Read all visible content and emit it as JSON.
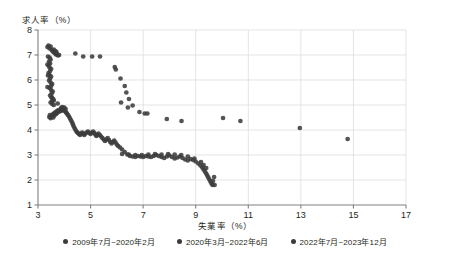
{
  "chart_data": {
    "type": "scatter",
    "title": "",
    "xlabel": "失業率（%）",
    "ylabel": "求人率（%）",
    "xlim": [
      3,
      17
    ],
    "ylim": [
      1,
      8
    ],
    "xticks": [
      3,
      5,
      7,
      9,
      11,
      13,
      15,
      17
    ],
    "yticks": [
      1,
      2,
      3,
      4,
      5,
      6,
      7,
      8
    ],
    "grid": true,
    "legend_position": "bottom",
    "marker_color": "#3c3c3c",
    "grid_color": "#d8d8d8",
    "axis_color": "#808080",
    "series": [
      {
        "name": "2009年7月~2020年2月",
        "color": "#3c3c3c",
        "points": [
          [
            3.43,
            4.52
          ],
          [
            3.45,
            4.6
          ],
          [
            3.48,
            4.47
          ],
          [
            3.52,
            4.55
          ],
          [
            3.55,
            4.62
          ],
          [
            3.58,
            4.5
          ],
          [
            3.6,
            4.66
          ],
          [
            3.62,
            4.58
          ],
          [
            3.65,
            4.7
          ],
          [
            3.68,
            4.63
          ],
          [
            3.7,
            4.74
          ],
          [
            3.72,
            4.68
          ],
          [
            3.75,
            4.78
          ],
          [
            3.78,
            4.72
          ],
          [
            3.8,
            4.8
          ],
          [
            3.83,
            4.75
          ],
          [
            3.86,
            4.82
          ],
          [
            3.9,
            4.77
          ],
          [
            3.93,
            4.83
          ],
          [
            3.96,
            4.79
          ],
          [
            4.0,
            4.8
          ],
          [
            4.04,
            4.74
          ],
          [
            4.07,
            4.7
          ],
          [
            4.1,
            4.66
          ],
          [
            4.14,
            4.6
          ],
          [
            4.18,
            4.54
          ],
          [
            4.22,
            4.46
          ],
          [
            4.26,
            4.38
          ],
          [
            4.3,
            4.3
          ],
          [
            4.33,
            4.22
          ],
          [
            4.36,
            4.14
          ],
          [
            4.4,
            4.06
          ],
          [
            4.44,
            3.98
          ],
          [
            4.48,
            3.92
          ],
          [
            4.52,
            3.88
          ],
          [
            4.56,
            3.84
          ],
          [
            4.6,
            3.8
          ],
          [
            4.64,
            3.86
          ],
          [
            4.68,
            3.9
          ],
          [
            4.72,
            3.84
          ],
          [
            4.76,
            3.8
          ],
          [
            4.8,
            3.86
          ],
          [
            4.85,
            3.9
          ],
          [
            4.9,
            3.94
          ],
          [
            4.95,
            3.88
          ],
          [
            5.0,
            3.84
          ],
          [
            5.05,
            3.9
          ],
          [
            5.1,
            3.94
          ],
          [
            5.14,
            3.88
          ],
          [
            5.18,
            3.82
          ],
          [
            5.22,
            3.76
          ],
          [
            5.26,
            3.8
          ],
          [
            5.3,
            3.86
          ],
          [
            5.35,
            3.8
          ],
          [
            5.4,
            3.74
          ],
          [
            5.45,
            3.68
          ],
          [
            5.5,
            3.62
          ],
          [
            5.55,
            3.56
          ],
          [
            5.6,
            3.62
          ],
          [
            5.65,
            3.68
          ],
          [
            5.7,
            3.6
          ],
          [
            5.75,
            3.52
          ],
          [
            5.8,
            3.46
          ],
          [
            5.85,
            3.52
          ],
          [
            5.9,
            3.58
          ],
          [
            5.95,
            3.5
          ],
          [
            6.0,
            3.42
          ],
          [
            6.05,
            3.36
          ],
          [
            6.12,
            3.3
          ],
          [
            6.2,
            3.22
          ],
          [
            6.3,
            3.12
          ],
          [
            6.4,
            3.02
          ],
          [
            6.5,
            2.96
          ],
          [
            6.6,
            2.94
          ],
          [
            6.7,
            2.92
          ],
          [
            6.8,
            2.96
          ],
          [
            6.9,
            2.94
          ],
          [
            7.0,
            2.92
          ],
          [
            7.1,
            2.96
          ],
          [
            7.2,
            2.94
          ],
          [
            7.3,
            2.92
          ],
          [
            7.4,
            2.96
          ],
          [
            7.5,
            3.0
          ],
          [
            7.6,
            2.96
          ],
          [
            7.7,
            2.92
          ],
          [
            7.8,
            2.88
          ],
          [
            7.9,
            2.94
          ],
          [
            8.0,
            2.98
          ],
          [
            8.1,
            2.92
          ],
          [
            8.2,
            2.86
          ],
          [
            8.3,
            2.9
          ],
          [
            8.4,
            2.94
          ],
          [
            8.5,
            2.88
          ],
          [
            8.6,
            2.82
          ],
          [
            8.7,
            2.78
          ],
          [
            8.8,
            2.84
          ],
          [
            8.9,
            2.8
          ],
          [
            9.0,
            2.74
          ],
          [
            9.1,
            2.66
          ],
          [
            9.18,
            2.58
          ],
          [
            9.25,
            2.5
          ],
          [
            9.3,
            2.42
          ],
          [
            9.35,
            2.34
          ],
          [
            9.4,
            2.26
          ],
          [
            9.44,
            2.18
          ],
          [
            9.48,
            2.1
          ],
          [
            9.52,
            2.02
          ],
          [
            9.56,
            1.94
          ],
          [
            9.6,
            1.86
          ],
          [
            9.64,
            1.8
          ],
          [
            9.4,
            2.48
          ],
          [
            9.3,
            2.6
          ],
          [
            9.2,
            2.72
          ],
          [
            8.95,
            2.86
          ],
          [
            8.7,
            2.94
          ],
          [
            8.45,
            3.0
          ],
          [
            8.2,
            3.02
          ],
          [
            7.95,
            3.04
          ],
          [
            7.7,
            3.02
          ],
          [
            7.45,
            3.04
          ],
          [
            7.2,
            3.02
          ],
          [
            6.95,
            3.0
          ],
          [
            6.7,
            3.0
          ],
          [
            6.45,
            3.02
          ],
          [
            6.2,
            3.04
          ],
          [
            3.88,
            4.88
          ],
          [
            3.92,
            4.92
          ],
          [
            3.96,
            4.86
          ],
          [
            4.0,
            4.9
          ],
          [
            4.05,
            4.84
          ]
        ]
      },
      {
        "name": "2020年3月~2022年6月",
        "color": "#3c3c3c",
        "points": [
          [
            3.52,
            5.3
          ],
          [
            3.6,
            5.18
          ],
          [
            3.75,
            5.06
          ],
          [
            4.42,
            7.06
          ],
          [
            4.72,
            6.94
          ],
          [
            5.06,
            6.94
          ],
          [
            5.36,
            6.94
          ],
          [
            5.92,
            6.52
          ],
          [
            5.96,
            6.42
          ],
          [
            6.14,
            6.06
          ],
          [
            6.3,
            5.76
          ],
          [
            6.36,
            5.5
          ],
          [
            6.46,
            5.24
          ],
          [
            6.6,
            4.98
          ],
          [
            6.86,
            4.72
          ],
          [
            7.06,
            4.66
          ],
          [
            7.16,
            4.66
          ],
          [
            6.16,
            5.1
          ],
          [
            6.42,
            4.9
          ],
          [
            7.9,
            4.44
          ],
          [
            8.46,
            4.36
          ],
          [
            10.7,
            4.36
          ],
          [
            10.04,
            4.48
          ],
          [
            12.96,
            4.08
          ],
          [
            14.78,
            3.64
          ],
          [
            9.72,
            1.8
          ],
          [
            9.66,
            1.96
          ],
          [
            9.7,
            2.12
          ]
        ]
      },
      {
        "name": "2022年7月~2023年12月",
        "color": "#3c3c3c",
        "points": [
          [
            3.36,
            7.32
          ],
          [
            3.4,
            7.38
          ],
          [
            3.44,
            7.26
          ],
          [
            3.48,
            7.34
          ],
          [
            3.52,
            7.2
          ],
          [
            3.56,
            7.14
          ],
          [
            3.6,
            7.22
          ],
          [
            3.64,
            7.08
          ],
          [
            3.68,
            7.02
          ],
          [
            3.72,
            7.04
          ],
          [
            3.76,
            6.98
          ],
          [
            3.8,
            7.0
          ],
          [
            3.44,
            6.9
          ],
          [
            3.48,
            6.82
          ],
          [
            3.42,
            6.74
          ],
          [
            3.46,
            6.66
          ],
          [
            3.4,
            6.58
          ],
          [
            3.44,
            6.5
          ],
          [
            3.5,
            6.44
          ],
          [
            3.46,
            6.36
          ],
          [
            3.4,
            6.28
          ],
          [
            3.44,
            6.2
          ],
          [
            3.5,
            6.14
          ],
          [
            3.46,
            6.06
          ],
          [
            3.42,
            5.98
          ],
          [
            3.48,
            5.9
          ],
          [
            3.54,
            5.84
          ],
          [
            3.5,
            5.76
          ],
          [
            3.44,
            5.68
          ],
          [
            3.5,
            5.6
          ],
          [
            3.56,
            5.54
          ],
          [
            3.52,
            5.46
          ],
          [
            3.46,
            5.38
          ],
          [
            3.52,
            5.3
          ],
          [
            3.58,
            5.24
          ],
          [
            3.54,
            5.16
          ],
          [
            3.48,
            5.1
          ],
          [
            3.54,
            5.04
          ],
          [
            3.6,
            5.0
          ],
          [
            3.38,
            6.94
          ],
          [
            3.36,
            6.62
          ],
          [
            3.38,
            6.18
          ],
          [
            3.36,
            5.72
          ],
          [
            3.62,
            7.1
          ],
          [
            3.66,
            7.16
          ],
          [
            3.7,
            7.12
          ]
        ]
      }
    ]
  },
  "legend": {
    "items": [
      {
        "label": "2009年7月~2020年2月",
        "color": "#3c3c3c"
      },
      {
        "label": "2020年3月~2022年6月",
        "color": "#3c3c3c"
      },
      {
        "label": "2022年7月~2023年12月",
        "color": "#3c3c3c"
      }
    ]
  }
}
